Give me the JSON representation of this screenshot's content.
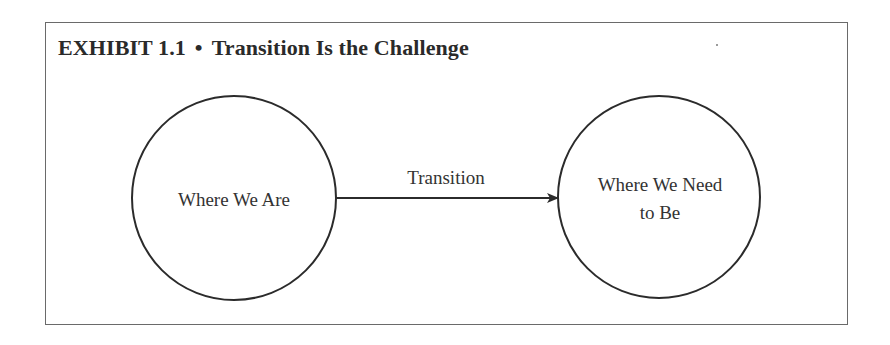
{
  "exhibit": {
    "number_label": "EXHIBIT 1.1",
    "separator": "•",
    "title": "Transition Is the Challenge"
  },
  "diagram": {
    "nodes": [
      {
        "id": "current",
        "label": "Where We Are"
      },
      {
        "id": "target",
        "label_line1": "Where We Need",
        "label_line2": "to Be"
      }
    ],
    "edges": [
      {
        "from": "current",
        "to": "target",
        "label": "Transition",
        "style": "arrow"
      }
    ]
  },
  "colors": {
    "stroke": "#2b2b2b",
    "frame": "#6a6a6a",
    "text": "#333333",
    "background": "#ffffff"
  }
}
